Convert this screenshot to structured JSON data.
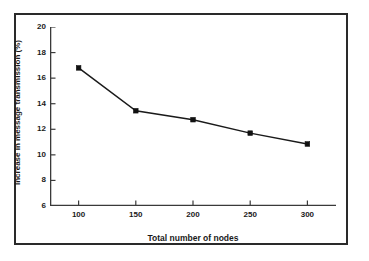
{
  "chart_data": {
    "type": "line",
    "title": "",
    "xlabel": "Total number of nodes",
    "ylabel": "Increase in message transmission (%)",
    "x": [
      100,
      150,
      200,
      250,
      300
    ],
    "values": [
      16.8,
      13.45,
      12.75,
      11.7,
      10.85
    ],
    "series": [
      {
        "name": "Increase in message transmission",
        "values": [
          16.8,
          13.45,
          12.75,
          11.7,
          10.85
        ]
      }
    ],
    "xlim": [
      75,
      325
    ],
    "ylim": [
      6,
      20
    ],
    "xticks": [
      100,
      150,
      200,
      250,
      300
    ],
    "yticks": [
      6,
      8,
      10,
      12,
      14,
      16,
      18,
      20
    ],
    "xtick_labels": [
      "100",
      "150",
      "200",
      "250",
      "300"
    ],
    "ytick_labels": [
      "6",
      "8",
      "10",
      "12",
      "14",
      "16",
      "18",
      "20"
    ],
    "grid": false,
    "legend": null,
    "marker": "square",
    "line_color": "#1a1a1a",
    "marker_color": "#111111",
    "axis_color": "#3a3a3a",
    "frame_color": "#2a2a2a",
    "background_color": "#ffffff"
  }
}
